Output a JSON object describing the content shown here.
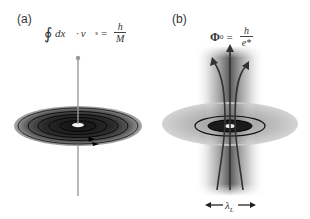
{
  "figure": {
    "panels": [
      {
        "id": "a",
        "label": "(a)",
        "equation": {
          "integral": "∮",
          "lhs_dx": "dx⃗",
          "dot": "·",
          "lhs_v": "v⃗",
          "lhs_v_sub": "s",
          "equals": "=",
          "numerator": "h",
          "denominator": "M"
        },
        "description": "Superfluid vortex: concentric circulation rings around a central vortex line"
      },
      {
        "id": "b",
        "label": "(b)",
        "equation": {
          "symbol": "Φ",
          "symbol_sub": "0",
          "equals": "=",
          "numerator": "h",
          "denominator": "e*"
        },
        "length_scale": {
          "symbol": "λ",
          "sub": "L"
        },
        "description": "Superconducting vortex: magnetic flux lines threading a disk, spread over penetration depth"
      }
    ],
    "colors": {
      "background": "#ffffff",
      "disk_dark": "#1a1a1a",
      "disk_mid": "#777777",
      "disk_light": "#bdbdbd",
      "vortex_line": "#9a9a9a",
      "flux_lines": "#333333",
      "text": "#333333"
    }
  }
}
